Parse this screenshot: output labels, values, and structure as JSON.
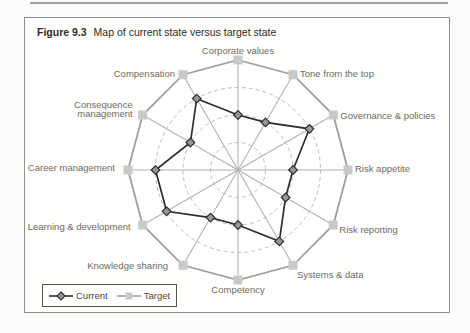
{
  "figure": {
    "label": "Figure 9.3",
    "caption": "Map of current state versus target state"
  },
  "legend": {
    "items": [
      {
        "label": "Current",
        "marker": "diamond-on-dark-line"
      },
      {
        "label": "Target",
        "marker": "square-on-gray-line"
      }
    ]
  },
  "chart_data": {
    "type": "radar",
    "categories": [
      "Corporate values",
      "Tone from the top",
      "Governance & policies",
      "Risk appetite",
      "Risk reporting",
      "Systems & data",
      "Competency",
      "Knowledge sharing",
      "Learning & development",
      "Career management",
      "Consequence\nmanagement",
      "Compensation"
    ],
    "series": [
      {
        "name": "Current",
        "values": [
          2,
          2,
          3,
          2,
          2,
          3,
          2,
          2,
          3,
          3,
          2,
          3
        ]
      },
      {
        "name": "Target",
        "values": [
          4,
          4,
          4,
          4,
          4,
          4,
          4,
          4,
          4,
          4,
          4,
          4
        ]
      }
    ],
    "scale": {
      "min": 0,
      "max": 4,
      "rings": [
        1,
        2,
        3
      ]
    },
    "grid": "dashed-circles",
    "legend_position": "bottom-left",
    "colors": {
      "current_line": "#2e2e2c",
      "current_marker_fill": "#979797",
      "target_line": "#9f9f9f",
      "target_marker_fill": "#c9c9c9",
      "spoke": "#b2b2b2",
      "grid": "#bcbcbc",
      "label": "#6e6a61"
    }
  }
}
